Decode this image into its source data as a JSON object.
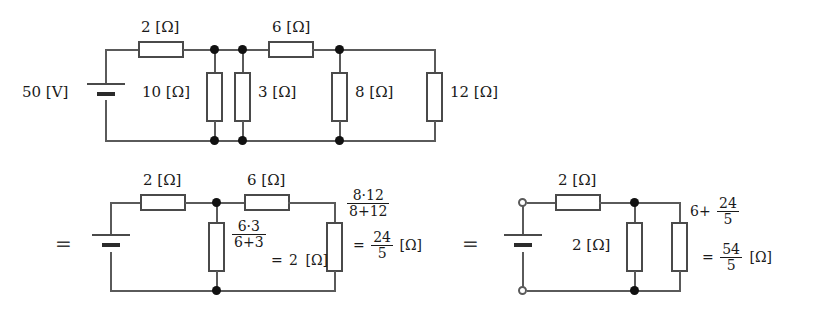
{
  "diagram": {
    "equals_signs": [
      "=",
      "="
    ],
    "circuits": [
      {
        "id": "original",
        "source": {
          "label": "50 [V]",
          "kind": "battery"
        },
        "series_resistors": [
          {
            "name": "r2",
            "label": "2 [Ω]"
          },
          {
            "name": "r6",
            "label": "6 [Ω]"
          }
        ],
        "shunt_resistors": [
          {
            "name": "r10",
            "label": "10 [Ω]"
          },
          {
            "name": "r3",
            "label": "3 [Ω]"
          },
          {
            "name": "r8",
            "label": "8 [Ω]"
          },
          {
            "name": "r12",
            "label": "12 [Ω]"
          }
        ]
      },
      {
        "id": "step1",
        "series_resistors": [
          {
            "name": "r2",
            "label": "2 [Ω]"
          },
          {
            "name": "r6",
            "label": "6 [Ω]"
          }
        ],
        "annotations": [
          {
            "name": "parallel-6-3",
            "num": "6·3",
            "den": "6+3",
            "result_prefix": "=",
            "result_value": "2",
            "unit": "[Ω]"
          },
          {
            "name": "parallel-8-12",
            "num": "8·12",
            "den": "8+12",
            "result_prefix": "=",
            "result_num": "24",
            "result_den": "5",
            "unit": "[Ω]"
          }
        ]
      },
      {
        "id": "step2",
        "terminals": [
          "top",
          "bottom"
        ],
        "series_resistors": [
          {
            "name": "r2",
            "label": "2 [Ω]"
          }
        ],
        "shunt_resistors": [
          {
            "name": "r2-parallel",
            "label": "2 [Ω]"
          }
        ],
        "annotations": [
          {
            "name": "series-6-plus-24-5",
            "lead": "6+",
            "num": "24",
            "den": "5",
            "result_prefix": "=",
            "result_num": "54",
            "result_den": "5",
            "unit": "[Ω]"
          }
        ]
      }
    ]
  }
}
